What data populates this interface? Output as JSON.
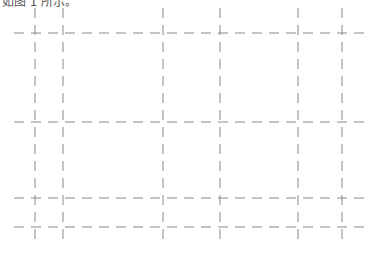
{
  "caption": {
    "text": "如图 1 所示。"
  },
  "grid": {
    "stroke": "#8a8a8a",
    "dash": "10 7",
    "vertical_lines_x": [
      35,
      63,
      163,
      220,
      298,
      342
    ],
    "vertical_extent": [
      8,
      243
    ],
    "horizontal_lines_y": [
      33,
      122,
      198,
      227
    ],
    "horizontal_extent": [
      14,
      366
    ]
  }
}
